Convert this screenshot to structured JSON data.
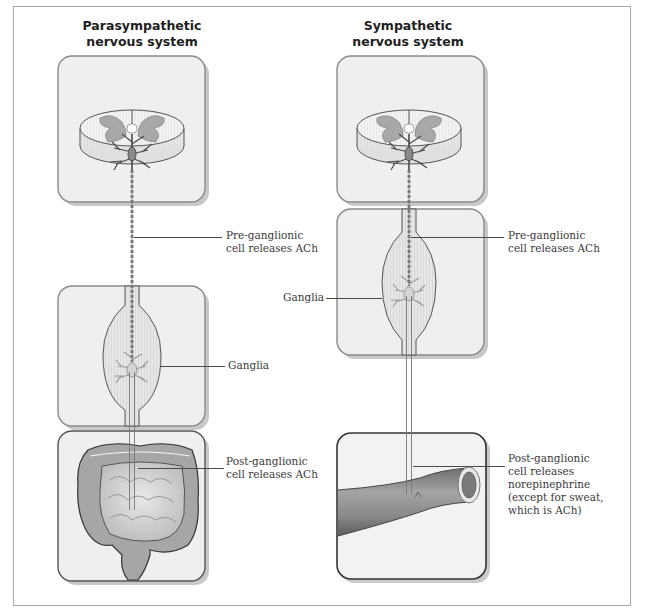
{
  "figure": {
    "columns": [
      {
        "id": "parasympathetic",
        "heading_line1": "Parasympathetic",
        "heading_line2": "nervous system",
        "panels": [
          "spinal-cord",
          "ganglia",
          "intestine"
        ],
        "labels": {
          "pre": [
            "Pre-ganglionic",
            "cell releases ACh"
          ],
          "ganglia": "Ganglia",
          "post": [
            "Post-ganglionic",
            "cell releases ACh"
          ]
        }
      },
      {
        "id": "sympathetic",
        "heading_line1": "Sympathetic",
        "heading_line2": "nervous system",
        "panels": [
          "spinal-cord",
          "ganglia",
          "blood-vessel"
        ],
        "labels": {
          "pre": [
            "Pre-ganglionic",
            "cell releases ACh"
          ],
          "ganglia": "Ganglia",
          "post": [
            "Post-ganglionic",
            "cell releases",
            "norepinephrine",
            "(except for sweat,",
            "which is ACh)"
          ]
        }
      }
    ],
    "colors": {
      "panel_fill": "#efefef",
      "panel_border": "#8a8a8a",
      "panel_shadow": "#c8c8c8",
      "cord_gray": "#9a9a9a",
      "neuron": "#5a5a5a",
      "vessel": "#8c8c8c",
      "intestine": "#a6a6a6",
      "frame_border": "#a9a9a9"
    }
  }
}
